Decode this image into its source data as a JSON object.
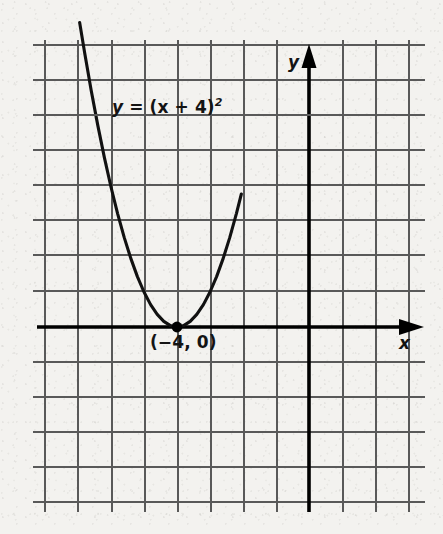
{
  "figure": {
    "kind": "coordinate-grid-parabola",
    "background_color": "#f3f2ef",
    "grid_line_color": "#595959",
    "axis_color": "#000000",
    "curve_color": "#111111"
  },
  "labels": {
    "equation_lhs": "y",
    "equation_eq": " = ",
    "equation_rhs": "(x + 4)",
    "equation_exponent": "2",
    "equation_full": "y = (x + 4)²",
    "vertex_point": "(−4, 0)",
    "y_axis": "y",
    "x_axis": "x"
  },
  "chart_data": {
    "type": "line",
    "title": "",
    "xlabel": "x",
    "ylabel": "y",
    "equation": "y = (x + 4)^2",
    "grid": true,
    "legend": "none",
    "xlim": [
      -8,
      4
    ],
    "ylim": [
      -5,
      9
    ],
    "xticks": [
      -8,
      -7,
      -6,
      -5,
      -4,
      -3,
      -2,
      -1,
      0,
      1,
      2,
      3,
      4
    ],
    "yticks": [
      -5,
      -4,
      -3,
      -2,
      -1,
      0,
      1,
      2,
      3,
      4,
      5,
      6,
      7,
      8,
      9
    ],
    "annotations": [
      {
        "text": "y = (x + 4)²",
        "x": -5.8,
        "y": 6.6
      },
      {
        "text": "(−4, 0)",
        "x": -4.0,
        "y": -0.55
      }
    ],
    "markers": [
      {
        "x": -4,
        "y": 0,
        "label": "(−4, 0)",
        "style": "filled-dot"
      }
    ],
    "series": [
      {
        "name": "y = (x + 4)^2",
        "x": [
          -6.95,
          -6.8,
          -6.6,
          -6.4,
          -6.2,
          -6.0,
          -5.8,
          -5.6,
          -5.4,
          -5.2,
          -5.0,
          -4.8,
          -4.6,
          -4.4,
          -4.2,
          -4.0,
          -3.8,
          -3.6,
          -3.4,
          -3.2,
          -3.0,
          -2.8,
          -2.6,
          -2.4,
          -2.2,
          -2.05
        ],
        "y": [
          8.7,
          7.84,
          6.76,
          5.76,
          4.84,
          4.0,
          3.24,
          2.56,
          1.96,
          1.44,
          1.0,
          0.64,
          0.36,
          0.16,
          0.04,
          0.0,
          0.04,
          0.16,
          0.36,
          0.64,
          1.0,
          1.44,
          1.96,
          2.56,
          3.24,
          3.8
        ]
      }
    ]
  },
  "geometry": {
    "grid_x_start": 45,
    "grid_x_step": 33,
    "grid_x_count": 12,
    "grid_y_start": 45,
    "grid_y_step": 35,
    "grid_y_count": 14,
    "origin_x": 309,
    "origin_y": 327,
    "vertex_x": 178,
    "vertex_y": 327
  }
}
